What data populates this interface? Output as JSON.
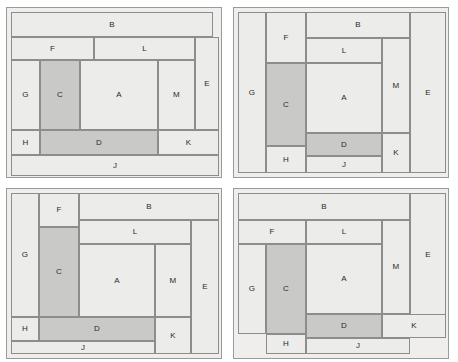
{
  "figure": {
    "type": "floor-plan-layout-comparison",
    "panel_count": 4,
    "room_labels": [
      "A",
      "B",
      "C",
      "D",
      "E",
      "F",
      "G",
      "H",
      "J",
      "K",
      "L",
      "M"
    ],
    "colors": {
      "panel_background": "#efeeec",
      "panel_border": "#9a9a98",
      "room_light_fill": "#ececea",
      "room_dark_fill": "#c9c9c7",
      "room_border": "#8d8d8b",
      "label_text": "#2a2a2a",
      "page_background": "#ffffff"
    },
    "highlighted_rooms": [
      "C",
      "D"
    ]
  },
  "panels": [
    {
      "name": "layout-1",
      "x": 6,
      "y": 7,
      "w": 216,
      "h": 171,
      "rooms": [
        {
          "label": "B",
          "x": 4,
          "y": 4,
          "w": 202,
          "h": 25,
          "fill": "light"
        },
        {
          "label": "F",
          "x": 4,
          "y": 29,
          "w": 83,
          "h": 23,
          "fill": "light"
        },
        {
          "label": "L",
          "x": 87,
          "y": 29,
          "w": 101,
          "h": 23,
          "fill": "light"
        },
        {
          "label": "E",
          "x": 188,
          "y": 29,
          "w": 24,
          "h": 93,
          "fill": "light"
        },
        {
          "label": "G",
          "x": 4,
          "y": 52,
          "w": 29,
          "h": 70,
          "fill": "light"
        },
        {
          "label": "C",
          "x": 33,
          "y": 52,
          "w": 40,
          "h": 70,
          "fill": "dark"
        },
        {
          "label": "A",
          "x": 73,
          "y": 52,
          "w": 78,
          "h": 70,
          "fill": "light"
        },
        {
          "label": "M",
          "x": 151,
          "y": 52,
          "w": 37,
          "h": 70,
          "fill": "light"
        },
        {
          "label": "H",
          "x": 4,
          "y": 122,
          "w": 29,
          "h": 25,
          "fill": "light"
        },
        {
          "label": "D",
          "x": 33,
          "y": 122,
          "w": 118,
          "h": 25,
          "fill": "dark"
        },
        {
          "label": "K",
          "x": 151,
          "y": 122,
          "w": 61,
          "h": 25,
          "fill": "light"
        },
        {
          "label": "J",
          "x": 4,
          "y": 147,
          "w": 208,
          "h": 21,
          "fill": "light"
        }
      ]
    },
    {
      "name": "layout-2",
      "x": 233,
      "y": 7,
      "w": 216,
      "h": 171,
      "rooms": [
        {
          "label": "G",
          "x": 4,
          "y": 4,
          "w": 28,
          "h": 161,
          "fill": "light"
        },
        {
          "label": "F",
          "x": 32,
          "y": 4,
          "w": 40,
          "h": 51,
          "fill": "light"
        },
        {
          "label": "B",
          "x": 72,
          "y": 4,
          "w": 104,
          "h": 26,
          "fill": "light"
        },
        {
          "label": "E",
          "x": 176,
          "y": 4,
          "w": 36,
          "h": 161,
          "fill": "light"
        },
        {
          "label": "L",
          "x": 72,
          "y": 30,
          "w": 76,
          "h": 25,
          "fill": "light"
        },
        {
          "label": "M",
          "x": 148,
          "y": 30,
          "w": 28,
          "h": 95,
          "fill": "light"
        },
        {
          "label": "C",
          "x": 32,
          "y": 55,
          "w": 40,
          "h": 83,
          "fill": "dark"
        },
        {
          "label": "A",
          "x": 72,
          "y": 55,
          "w": 76,
          "h": 70,
          "fill": "light"
        },
        {
          "label": "D",
          "x": 72,
          "y": 125,
          "w": 76,
          "h": 23,
          "fill": "dark"
        },
        {
          "label": "K",
          "x": 148,
          "y": 125,
          "w": 28,
          "h": 40,
          "fill": "light"
        },
        {
          "label": "H",
          "x": 32,
          "y": 138,
          "w": 40,
          "h": 27,
          "fill": "light"
        },
        {
          "label": "J",
          "x": 72,
          "y": 148,
          "w": 76,
          "h": 17,
          "fill": "light"
        }
      ]
    },
    {
      "name": "layout-3",
      "x": 6,
      "y": 188,
      "w": 216,
      "h": 171,
      "rooms": [
        {
          "label": "G",
          "x": 4,
          "y": 4,
          "w": 28,
          "h": 124,
          "fill": "light"
        },
        {
          "label": "F",
          "x": 32,
          "y": 4,
          "w": 40,
          "h": 34,
          "fill": "light"
        },
        {
          "label": "B",
          "x": 72,
          "y": 4,
          "w": 140,
          "h": 27,
          "fill": "light"
        },
        {
          "label": "L",
          "x": 72,
          "y": 31,
          "w": 112,
          "h": 24,
          "fill": "light"
        },
        {
          "label": "E",
          "x": 184,
          "y": 31,
          "w": 28,
          "h": 134,
          "fill": "light"
        },
        {
          "label": "C",
          "x": 32,
          "y": 38,
          "w": 40,
          "h": 90,
          "fill": "dark"
        },
        {
          "label": "A",
          "x": 72,
          "y": 55,
          "w": 76,
          "h": 73,
          "fill": "light"
        },
        {
          "label": "M",
          "x": 148,
          "y": 55,
          "w": 36,
          "h": 73,
          "fill": "light"
        },
        {
          "label": "H",
          "x": 4,
          "y": 128,
          "w": 28,
          "h": 24,
          "fill": "light"
        },
        {
          "label": "D",
          "x": 32,
          "y": 128,
          "w": 116,
          "h": 24,
          "fill": "dark"
        },
        {
          "label": "K",
          "x": 148,
          "y": 128,
          "w": 36,
          "h": 37,
          "fill": "light"
        },
        {
          "label": "J",
          "x": 4,
          "y": 152,
          "w": 144,
          "h": 13,
          "fill": "light"
        }
      ]
    },
    {
      "name": "layout-4",
      "x": 233,
      "y": 188,
      "w": 216,
      "h": 171,
      "rooms": [
        {
          "label": "B",
          "x": 4,
          "y": 4,
          "w": 172,
          "h": 27,
          "fill": "light"
        },
        {
          "label": "E",
          "x": 176,
          "y": 4,
          "w": 36,
          "h": 124,
          "fill": "light"
        },
        {
          "label": "F",
          "x": 4,
          "y": 31,
          "w": 68,
          "h": 24,
          "fill": "light"
        },
        {
          "label": "L",
          "x": 72,
          "y": 31,
          "w": 76,
          "h": 24,
          "fill": "light"
        },
        {
          "label": "M",
          "x": 148,
          "y": 31,
          "w": 28,
          "h": 94,
          "fill": "light"
        },
        {
          "label": "G",
          "x": 4,
          "y": 55,
          "w": 28,
          "h": 90,
          "fill": "light"
        },
        {
          "label": "C",
          "x": 32,
          "y": 55,
          "w": 40,
          "h": 90,
          "fill": "dark"
        },
        {
          "label": "A",
          "x": 72,
          "y": 55,
          "w": 76,
          "h": 70,
          "fill": "light"
        },
        {
          "label": "D",
          "x": 72,
          "y": 125,
          "w": 76,
          "h": 24,
          "fill": "dark"
        },
        {
          "label": "K",
          "x": 148,
          "y": 125,
          "w": 64,
          "h": 24,
          "fill": "light"
        },
        {
          "label": "H",
          "x": 32,
          "y": 145,
          "w": 40,
          "h": 20,
          "fill": "light"
        },
        {
          "label": "J",
          "x": 72,
          "y": 149,
          "w": 104,
          "h": 16,
          "fill": "light"
        }
      ]
    }
  ]
}
